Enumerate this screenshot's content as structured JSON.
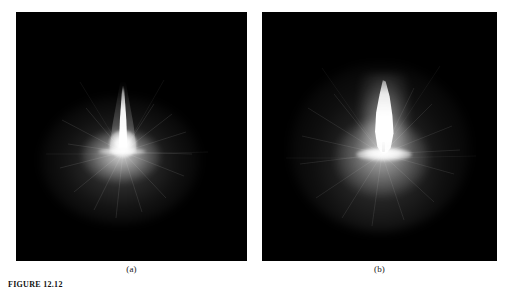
{
  "figure": {
    "background_color": "#ffffff",
    "caption": "FIGURE 12.12",
    "panels": [
      {
        "id": "a",
        "label": "(a)",
        "background_color": "#000000",
        "subject": "candle-flame",
        "description": "narrow bright vertical flame spike with diffuse radial halo at base",
        "flame_color": "#ffffff"
      },
      {
        "id": "b",
        "label": "(b)",
        "background_color": "#000000",
        "subject": "candle-flame",
        "description": "larger teardrop candle flame with visible wick and bright candle-top band",
        "flame_color": "#ffffff"
      }
    ]
  }
}
